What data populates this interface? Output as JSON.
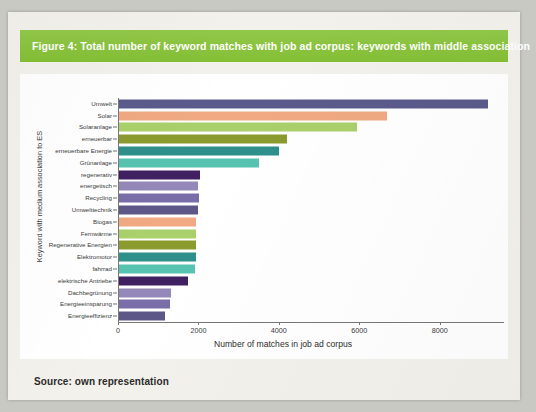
{
  "figure": {
    "banner_title": "Figure 4: Total number of keyword matches with job ad corpus: keywords with middle association",
    "source_note": "Source: own representation",
    "banner_color": "#8cc63e"
  },
  "chart_data": {
    "type": "bar",
    "orientation": "horizontal",
    "title": "Figure 4: Total number of keyword matches with job ad corpus: keywords with middle association",
    "xlabel": "Number of matches in job ad corpus",
    "ylabel": "Keyword with medium association to ES",
    "xlim": [
      0,
      9600
    ],
    "ylim": null,
    "grid": false,
    "legend": "none",
    "xticks": [
      0,
      2000,
      4000,
      6000,
      8000
    ],
    "xtick_labels": [
      "0",
      "2000",
      "4000",
      "6000",
      "8000"
    ],
    "categories": [
      "Umwelt",
      "Solar",
      "Solaranlage",
      "erneuerbar",
      "erneuerbare Energie",
      "Grünanlage",
      "regenerativ",
      "energetisch",
      "Recycling",
      "Umwelttechnik",
      "Biogas",
      "Fernwärme",
      "Regenerative Energien",
      "Elektromotor",
      "fahrrad",
      "elektrische Antriebe",
      "Dachbegrünung",
      "Energieeinsparung",
      "Energieeffizienz"
    ],
    "values": [
      9200,
      6700,
      5950,
      4200,
      4000,
      3500,
      2050,
      2000,
      2020,
      2000,
      1950,
      1950,
      1930,
      1930,
      1920,
      1750,
      1320,
      1300,
      1180
    ],
    "colors": [
      "#5a5a8c",
      "#f0a982",
      "#a9d06a",
      "#8b9b2e",
      "#2f8f8b",
      "#56c3b0",
      "#402060",
      "#9388b8",
      "#7a6ea8",
      "#5c5787",
      "#f0a982",
      "#a9d06a",
      "#8b9b2e",
      "#2f8f8b",
      "#56c3b0",
      "#402060",
      "#9388b8",
      "#7a6ea8",
      "#5c5787"
    ]
  }
}
